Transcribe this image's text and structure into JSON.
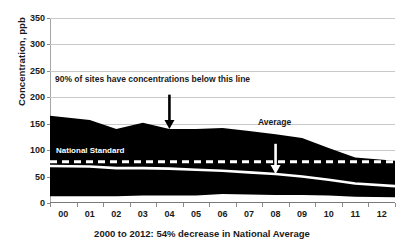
{
  "chart_data": {
    "type": "area",
    "title": "",
    "caption": "2000 to 2012: 54% decrease in National Average",
    "xlabel": "2000 to 2012: 54% decrease in National Average",
    "ylabel": "Concentration, ppb",
    "ylim": [
      0,
      350
    ],
    "y_ticks": [
      0,
      50,
      100,
      150,
      200,
      250,
      300,
      350
    ],
    "grid": true,
    "legend_position": "none",
    "x": [
      "00",
      "01",
      "02",
      "03",
      "04",
      "05",
      "06",
      "07",
      "08",
      "09",
      "10",
      "11",
      "12"
    ],
    "x_tick_labels": [
      "00",
      "01",
      "02",
      "03",
      "04",
      "05",
      "06",
      "07",
      "08",
      "09",
      "10",
      "11",
      "12"
    ],
    "series": [
      {
        "name": "90th Percentile",
        "role": "band-upper",
        "color": "#000000",
        "values": [
          165,
          157,
          140,
          152,
          140,
          140,
          142,
          136,
          130,
          123,
          104,
          86,
          80
        ]
      },
      {
        "name": "Average",
        "role": "mean-line",
        "color": "#ffffff",
        "values": [
          70,
          69,
          66,
          66,
          65,
          63,
          61,
          58,
          55,
          50,
          44,
          37,
          32
        ]
      },
      {
        "name": "10th Percentile",
        "role": "band-lower",
        "color": "#000000",
        "values": [
          13,
          13,
          13,
          14,
          14,
          14,
          17,
          16,
          15,
          15,
          14,
          12,
          11
        ]
      },
      {
        "name": "National Standard",
        "role": "threshold-line",
        "color": "#ffffff",
        "value": 78
      }
    ],
    "annotations": [
      {
        "id": "percentile-note",
        "text": "90% of sites have concentrations below this line",
        "arrow": "down",
        "arrow_color": "#000000",
        "points_to_x": "04",
        "points_to_y": 140
      },
      {
        "id": "average-note",
        "text": "Average",
        "arrow": "down",
        "arrow_color": "#ffffff",
        "points_to_x": "08",
        "points_to_y": 55
      },
      {
        "id": "standard-note",
        "text": "National Standard",
        "arrow": "none",
        "arrow_color": "#ffffff",
        "points_to_y": 78
      }
    ],
    "colors": {
      "band_fill": "#000000",
      "mean_line": "#ffffff",
      "threshold_line": "#ffffff",
      "gridline": "#c9c9c9",
      "axis": "#8c8c8c",
      "background": "#ffffff",
      "text": "#1a1a1a"
    }
  },
  "y_axis": {
    "title": "Concentration, ppb",
    "ticks": [
      "350",
      "300",
      "250",
      "200",
      "150",
      "100",
      "50",
      "0"
    ]
  },
  "x_axis": {
    "ticks": [
      "00",
      "01",
      "02",
      "03",
      "04",
      "05",
      "06",
      "07",
      "08",
      "09",
      "10",
      "11",
      "12"
    ],
    "caption": "2000 to 2012: 54% decrease in National Average"
  },
  "labels": {
    "percentile_note": "90% of sites have concentrations below this line",
    "average_note": "Average",
    "standard_note": "National Standard"
  }
}
